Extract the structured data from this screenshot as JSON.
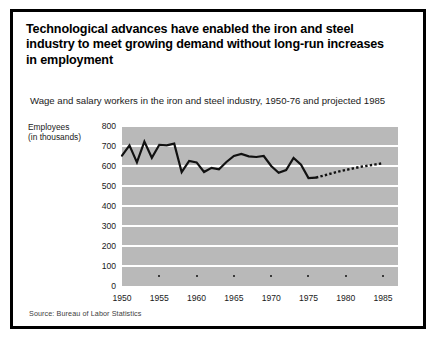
{
  "headline": "Technological advances have enabled the iron and steel industry to meet growing demand without long-run increases in employment",
  "subtitle": "Wage and salary workers in the iron and steel industry, 1950-76 and projected 1985",
  "axis_title_line1": "Employees",
  "axis_title_line2": "(in thousands)",
  "source": "Source: Bureau of Labor Statistics",
  "colors": {
    "plot_background": "#b9b9b9",
    "gridline": "#ffffff",
    "series_line": "#111111",
    "frame": "#000000",
    "text": "#1a1a1a"
  },
  "chart_data": {
    "type": "line",
    "title": "Wage and salary workers in the iron and steel industry, 1950-76 and projected 1985",
    "xlabel": "",
    "ylabel": "Employees (in thousands)",
    "ylim": [
      0,
      800
    ],
    "xlim": [
      1950,
      1987
    ],
    "grid": true,
    "legend": false,
    "ytick_labels": [
      "800",
      "700",
      "600",
      "500",
      "400",
      "300",
      "200",
      "100",
      "0"
    ],
    "ytick_values": [
      800,
      700,
      600,
      500,
      400,
      300,
      200,
      100,
      0
    ],
    "xtick_labels": [
      "1950",
      "1955",
      "1960",
      "1965",
      "1970",
      "1975",
      "1980",
      "1985"
    ],
    "xtick_values": [
      1950,
      1955,
      1960,
      1965,
      1970,
      1975,
      1980,
      1985
    ],
    "series": [
      {
        "name": "Actual",
        "style": "solid",
        "x": [
          1950,
          1951,
          1952,
          1953,
          1954,
          1955,
          1956,
          1957,
          1958,
          1959,
          1960,
          1961,
          1962,
          1963,
          1964,
          1965,
          1966,
          1967,
          1968,
          1969,
          1970,
          1971,
          1972,
          1973,
          1974,
          1975,
          1976
        ],
        "values": [
          652,
          703,
          618,
          722,
          641,
          706,
          703,
          712,
          569,
          625,
          618,
          570,
          591,
          583,
          620,
          650,
          660,
          648,
          645,
          650,
          600,
          566,
          580,
          640,
          607,
          540,
          542
        ]
      },
      {
        "name": "Projected",
        "style": "dotted",
        "x": [
          1976,
          1977,
          1978,
          1979,
          1980,
          1981,
          1982,
          1983,
          1984,
          1985
        ],
        "values": [
          542,
          552,
          562,
          572,
          580,
          588,
          596,
          602,
          608,
          614
        ]
      }
    ]
  }
}
